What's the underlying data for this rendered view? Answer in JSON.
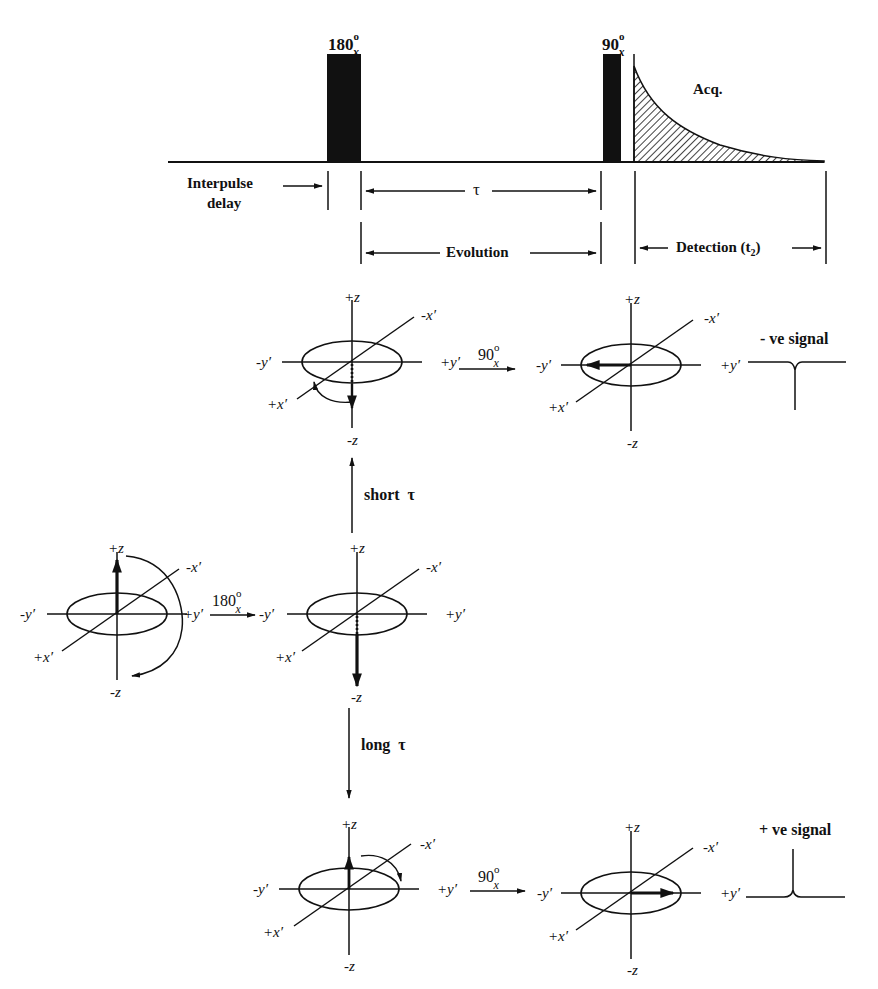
{
  "figure": {
    "colors": {
      "ink": "#111111",
      "background": "#ffffff"
    }
  },
  "pulse_sequence": {
    "pulses": [
      {
        "id": "pulse-180",
        "angle": "180",
        "unit": "o",
        "phase": "x",
        "x_start": 327,
        "x_end": 361
      },
      {
        "id": "pulse-90",
        "angle": "90",
        "unit": "o",
        "phase": "x",
        "x_start": 603,
        "x_end": 621
      }
    ],
    "fid_label": "Acq.",
    "intervals": {
      "interpulse_delay": [
        "Interpulse",
        "delay"
      ],
      "tau": "τ",
      "evolution": "Evolution",
      "detection": "Detection (t",
      "detection_sub": "2",
      "detection_close": ")"
    }
  },
  "vector_model": {
    "axis_labels": {
      "plus_z": "+z",
      "minus_z": "-z",
      "plus_y": "+y′",
      "minus_y": "-y′",
      "plus_x": "+x′",
      "minus_x": "-x′"
    },
    "transitions": {
      "pulse_180": {
        "angle": "180",
        "unit": "o",
        "phase": "x"
      },
      "pulse_90_top": {
        "angle": "90",
        "unit": "o",
        "phase": "x"
      },
      "pulse_90_bottom": {
        "angle": "90",
        "unit": "o",
        "phase": "x"
      },
      "short_tau": "short  τ",
      "long_tau": "long  τ"
    },
    "diagrams": [
      {
        "id": "equilibrium",
        "cx": 117,
        "cy": 614,
        "magnetization": "+z"
      },
      {
        "id": "after-180",
        "cx": 357,
        "cy": 614,
        "magnetization": "-z"
      },
      {
        "id": "short-tau-state",
        "cx": 352,
        "cy": 362,
        "magnetization": "-z (partially relaxed)"
      },
      {
        "id": "short-tau-detect",
        "cx": 631,
        "cy": 365,
        "magnetization": "-y′"
      },
      {
        "id": "long-tau-state",
        "cx": 349,
        "cy": 889,
        "magnetization": "+z"
      },
      {
        "id": "long-tau-detect",
        "cx": 631,
        "cy": 893,
        "magnetization": "+y′"
      }
    ],
    "signals": {
      "negative": "- ve signal",
      "positive": "+ ve signal"
    }
  }
}
